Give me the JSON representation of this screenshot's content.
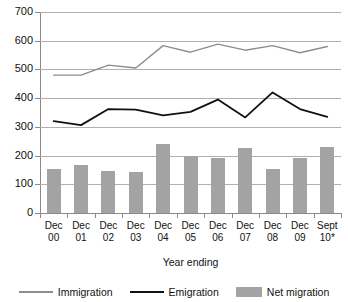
{
  "chart_data": {
    "type": "bar",
    "title": "",
    "xlabel": "Year ending",
    "ylabel": "",
    "ylim": [
      0,
      700
    ],
    "ytick_step": 100,
    "yticks": [
      700,
      600,
      500,
      400,
      300,
      200,
      100,
      0
    ],
    "grid": true,
    "legend_position": "bottom",
    "categories": [
      "Dec 00",
      "Dec 01",
      "Dec 02",
      "Dec 03",
      "Dec 04",
      "Dec 05",
      "Dec 06",
      "Dec 07",
      "Dec 08",
      "Dec 09",
      "Sept 10*"
    ],
    "category_lines": [
      [
        "Dec",
        "00"
      ],
      [
        "Dec",
        "01"
      ],
      [
        "Dec",
        "02"
      ],
      [
        "Dec",
        "03"
      ],
      [
        "Dec",
        "04"
      ],
      [
        "Dec",
        "05"
      ],
      [
        "Dec",
        "06"
      ],
      [
        "Dec",
        "07"
      ],
      [
        "Dec",
        "08"
      ],
      [
        "Dec",
        "09"
      ],
      [
        "Sept",
        "10*"
      ]
    ],
    "series": [
      {
        "name": "Immigration",
        "type": "line",
        "color": "#8d8d8d",
        "values": [
          480,
          480,
          515,
          505,
          583,
          560,
          588,
          567,
          583,
          558,
          580
        ]
      },
      {
        "name": "Emigration",
        "type": "line",
        "color": "#111111",
        "values": [
          320,
          306,
          362,
          360,
          340,
          352,
          395,
          333,
          420,
          362,
          335
        ]
      },
      {
        "name": "Net migration",
        "type": "bar",
        "color": "#a3a3a3",
        "values": [
          152,
          166,
          148,
          143,
          240,
          200,
          193,
          226,
          153,
          190,
          230
        ]
      }
    ]
  },
  "legend": {
    "items": [
      {
        "label": "Immigration",
        "marker": "line",
        "color": "#8d8d8d"
      },
      {
        "label": "Emigration",
        "marker": "line",
        "color": "#111111"
      },
      {
        "label": "Net migration",
        "marker": "box",
        "color": "#a3a3a3"
      }
    ]
  },
  "colors": {
    "immigration_line": "#8d8d8d",
    "emigration_line": "#111111",
    "net_migration_bar": "#a3a3a3",
    "gridline": "#b0b0b0",
    "axis": "#8a8a8a"
  }
}
